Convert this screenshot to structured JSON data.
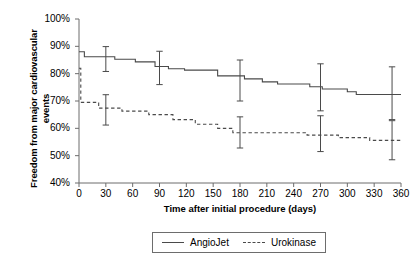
{
  "chart_data": {
    "type": "line",
    "title": "",
    "xlabel": "Time after initial procedure (days)",
    "ylabel": "Freedom from major cardiovascular events",
    "xlim": [
      0,
      360
    ],
    "ylim": [
      40,
      100
    ],
    "xticks": [
      "0",
      "30",
      "60",
      "90",
      "120",
      "150",
      "180",
      "210",
      "240",
      "270",
      "300",
      "330",
      "360"
    ],
    "yticks": [
      "100%",
      "90%",
      "80%",
      "70%",
      "60%",
      "50%",
      "40%"
    ],
    "grid": false,
    "legend_position": "below-axes",
    "series": [
      {
        "name": "AngioJet",
        "style": "solid",
        "color": "#4a4a4a",
        "step_points": [
          {
            "x": 0,
            "y": 88
          },
          {
            "x": 6,
            "y": 88
          },
          {
            "x": 6,
            "y": 86.2
          },
          {
            "x": 40,
            "y": 86.2
          },
          {
            "x": 40,
            "y": 85.3
          },
          {
            "x": 63,
            "y": 85.3
          },
          {
            "x": 63,
            "y": 84.3
          },
          {
            "x": 85,
            "y": 84.3
          },
          {
            "x": 85,
            "y": 82.6
          },
          {
            "x": 100,
            "y": 82.6
          },
          {
            "x": 100,
            "y": 81.8
          },
          {
            "x": 118,
            "y": 81.8
          },
          {
            "x": 118,
            "y": 81.3
          },
          {
            "x": 155,
            "y": 81.3
          },
          {
            "x": 155,
            "y": 79.2
          },
          {
            "x": 185,
            "y": 79.2
          },
          {
            "x": 185,
            "y": 78.1
          },
          {
            "x": 205,
            "y": 78.1
          },
          {
            "x": 205,
            "y": 77.0
          },
          {
            "x": 222,
            "y": 77.0
          },
          {
            "x": 222,
            "y": 76.2
          },
          {
            "x": 258,
            "y": 76.2
          },
          {
            "x": 258,
            "y": 75.2
          },
          {
            "x": 272,
            "y": 75.2
          },
          {
            "x": 272,
            "y": 74.4
          },
          {
            "x": 300,
            "y": 74.4
          },
          {
            "x": 300,
            "y": 73.4
          },
          {
            "x": 310,
            "y": 73.4
          },
          {
            "x": 310,
            "y": 72.4
          },
          {
            "x": 360,
            "y": 72.4
          }
        ],
        "error_bars": [
          {
            "x": 30,
            "y": 85.4,
            "lower": 80.8,
            "upper": 89.9
          },
          {
            "x": 90,
            "y": 82.0,
            "lower": 76.0,
            "upper": 88.2
          },
          {
            "x": 180,
            "y": 77.5,
            "lower": 70.0,
            "upper": 85.0
          },
          {
            "x": 270,
            "y": 75.0,
            "lower": 66.4,
            "upper": 83.6
          },
          {
            "x": 350,
            "y": 72.8,
            "lower": 63.2,
            "upper": 82.5
          }
        ]
      },
      {
        "name": "Urokinase",
        "style": "dashed",
        "color": "#4a4a4a",
        "step_points": [
          {
            "x": 0,
            "y": 82
          },
          {
            "x": 2,
            "y": 82
          },
          {
            "x": 2,
            "y": 69.5
          },
          {
            "x": 22,
            "y": 69.5
          },
          {
            "x": 22,
            "y": 67.4
          },
          {
            "x": 48,
            "y": 67.4
          },
          {
            "x": 48,
            "y": 66.3
          },
          {
            "x": 78,
            "y": 66.3
          },
          {
            "x": 78,
            "y": 65.0
          },
          {
            "x": 105,
            "y": 65.0
          },
          {
            "x": 105,
            "y": 63.2
          },
          {
            "x": 130,
            "y": 63.2
          },
          {
            "x": 130,
            "y": 61.5
          },
          {
            "x": 155,
            "y": 61.5
          },
          {
            "x": 155,
            "y": 60.0
          },
          {
            "x": 172,
            "y": 60.0
          },
          {
            "x": 172,
            "y": 58.4
          },
          {
            "x": 255,
            "y": 58.4
          },
          {
            "x": 255,
            "y": 57.5
          },
          {
            "x": 290,
            "y": 57.5
          },
          {
            "x": 290,
            "y": 56.6
          },
          {
            "x": 325,
            "y": 56.6
          },
          {
            "x": 325,
            "y": 55.6
          },
          {
            "x": 360,
            "y": 55.6
          }
        ],
        "error_bars": [
          {
            "x": 30,
            "y": 67.0,
            "lower": 61.2,
            "upper": 72.3
          },
          {
            "x": 180,
            "y": 58.4,
            "lower": 52.8,
            "upper": 64.2
          },
          {
            "x": 270,
            "y": 58.0,
            "lower": 51.5,
            "upper": 64.6
          },
          {
            "x": 350,
            "y": 55.6,
            "lower": 48.5,
            "upper": 62.8
          }
        ]
      }
    ]
  },
  "legend": {
    "items": [
      {
        "label": "AngioJet",
        "style": "solid"
      },
      {
        "label": "Urokinase",
        "style": "dashed"
      }
    ]
  }
}
